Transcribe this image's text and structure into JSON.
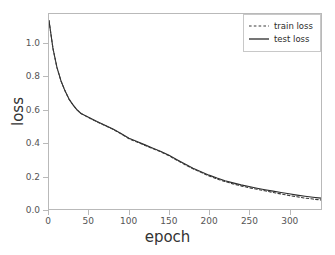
{
  "chart_data": {
    "type": "line",
    "title": "",
    "xlabel": "epoch",
    "ylabel": "loss",
    "xlim": [
      0,
      340
    ],
    "ylim": [
      0.0,
      1.18
    ],
    "grid": false,
    "legend_position": "upper right",
    "xticks": [
      0,
      50,
      100,
      150,
      200,
      250,
      300
    ],
    "xtick_labels": [
      "0",
      "50",
      "100",
      "150",
      "200",
      "250",
      "300"
    ],
    "yticks": [
      0.0,
      0.2,
      0.4,
      0.6,
      0.8,
      1.0
    ],
    "ytick_labels": [
      "0.0",
      "0.2",
      "0.4",
      "0.6",
      "0.8",
      "1.0"
    ],
    "x": [
      0,
      5,
      10,
      15,
      20,
      25,
      30,
      35,
      40,
      45,
      50,
      60,
      70,
      80,
      90,
      100,
      110,
      120,
      130,
      140,
      150,
      160,
      170,
      180,
      190,
      200,
      210,
      220,
      230,
      240,
      250,
      260,
      270,
      280,
      290,
      300,
      310,
      320,
      330,
      340
    ],
    "series": [
      {
        "name": "train loss",
        "style": "dashed",
        "color": "#3a3a3a",
        "values": [
          1.14,
          0.97,
          0.855,
          0.775,
          0.715,
          0.665,
          0.63,
          0.6,
          0.578,
          0.565,
          0.552,
          0.527,
          0.505,
          0.482,
          0.455,
          0.425,
          0.405,
          0.385,
          0.365,
          0.345,
          0.322,
          0.295,
          0.268,
          0.243,
          0.222,
          0.2,
          0.182,
          0.166,
          0.152,
          0.14,
          0.129,
          0.119,
          0.11,
          0.1,
          0.091,
          0.082,
          0.074,
          0.066,
          0.06,
          0.055
        ]
      },
      {
        "name": "test loss",
        "style": "solid",
        "color": "#2b2b2b",
        "values": [
          1.14,
          0.97,
          0.855,
          0.775,
          0.715,
          0.665,
          0.63,
          0.6,
          0.578,
          0.566,
          0.554,
          0.529,
          0.507,
          0.484,
          0.457,
          0.428,
          0.408,
          0.388,
          0.368,
          0.348,
          0.325,
          0.298,
          0.272,
          0.247,
          0.226,
          0.205,
          0.187,
          0.171,
          0.158,
          0.146,
          0.136,
          0.126,
          0.117,
          0.108,
          0.1,
          0.092,
          0.084,
          0.077,
          0.071,
          0.066
        ]
      }
    ]
  },
  "legend": {
    "items": [
      {
        "label": "train loss"
      },
      {
        "label": "test loss"
      }
    ]
  },
  "axes": {
    "xlabel": "epoch",
    "ylabel": "loss"
  }
}
